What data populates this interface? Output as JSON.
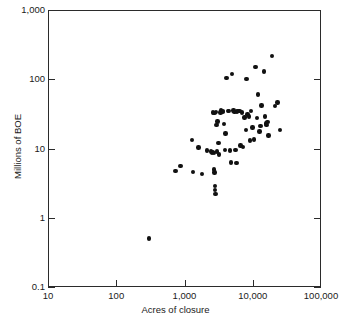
{
  "chart_data": {
    "type": "scatter",
    "title": "",
    "xlabel": "Acres of closure",
    "ylabel": "Millions of BOE",
    "xscale": "log",
    "yscale": "log",
    "xlim": [
      10,
      100000
    ],
    "ylim": [
      0.1,
      1000
    ],
    "grid": false,
    "legend": null,
    "xticklabels": [
      "10",
      "100",
      "1,000",
      "10,000",
      "100,000"
    ],
    "xtickvalues": [
      10,
      100,
      1000,
      10000,
      100000
    ],
    "yticklabels": [
      "1,000",
      "100",
      "10",
      "1",
      "0.1"
    ],
    "ytickvalues": [
      1000,
      100,
      10,
      1,
      0.1
    ],
    "marker": "filled-circle",
    "marker_color": "#111111",
    "n_points": 73,
    "points": [
      {
        "x": 300,
        "y": 0.5
      },
      {
        "x": 740,
        "y": 4.7
      },
      {
        "x": 870,
        "y": 5.6
      },
      {
        "x": 1290,
        "y": 13.2
      },
      {
        "x": 1320,
        "y": 4.6
      },
      {
        "x": 1600,
        "y": 10.3
      },
      {
        "x": 1800,
        "y": 4.3
      },
      {
        "x": 2150,
        "y": 9.3
      },
      {
        "x": 2450,
        "y": 9.0
      },
      {
        "x": 2550,
        "y": 8.8
      },
      {
        "x": 2600,
        "y": 8.9
      },
      {
        "x": 2700,
        "y": 8.7
      },
      {
        "x": 2680,
        "y": 5.0
      },
      {
        "x": 2750,
        "y": 4.5
      },
      {
        "x": 2800,
        "y": 2.9
      },
      {
        "x": 2820,
        "y": 2.5
      },
      {
        "x": 2850,
        "y": 2.2
      },
      {
        "x": 2600,
        "y": 33.0
      },
      {
        "x": 2750,
        "y": 32.5
      },
      {
        "x": 2880,
        "y": 33.5
      },
      {
        "x": 2950,
        "y": 22.0
      },
      {
        "x": 3050,
        "y": 24.5
      },
      {
        "x": 3150,
        "y": 12.0
      },
      {
        "x": 3200,
        "y": 8.2
      },
      {
        "x": 3350,
        "y": 33.0
      },
      {
        "x": 3450,
        "y": 35.5
      },
      {
        "x": 3600,
        "y": 34.0
      },
      {
        "x": 3700,
        "y": 35.0
      },
      {
        "x": 3800,
        "y": 22.5
      },
      {
        "x": 3900,
        "y": 9.5
      },
      {
        "x": 4000,
        "y": 16.5
      },
      {
        "x": 4100,
        "y": 105.0
      },
      {
        "x": 4300,
        "y": 34.5
      },
      {
        "x": 4500,
        "y": 35.0
      },
      {
        "x": 4600,
        "y": 9.4
      },
      {
        "x": 4800,
        "y": 6.3
      },
      {
        "x": 5000,
        "y": 120.0
      },
      {
        "x": 5200,
        "y": 35.5
      },
      {
        "x": 5400,
        "y": 34.0
      },
      {
        "x": 5600,
        "y": 9.6
      },
      {
        "x": 5800,
        "y": 6.2
      },
      {
        "x": 6100,
        "y": 35.0
      },
      {
        "x": 6400,
        "y": 34.5
      },
      {
        "x": 6600,
        "y": 11.0
      },
      {
        "x": 6900,
        "y": 33.0
      },
      {
        "x": 7200,
        "y": 10.5
      },
      {
        "x": 7600,
        "y": 28.0
      },
      {
        "x": 7900,
        "y": 18.5
      },
      {
        "x": 8100,
        "y": 100.0
      },
      {
        "x": 8400,
        "y": 31.0
      },
      {
        "x": 8800,
        "y": 29.0
      },
      {
        "x": 9100,
        "y": 13.0
      },
      {
        "x": 9500,
        "y": 35.0
      },
      {
        "x": 9900,
        "y": 20.0
      },
      {
        "x": 10500,
        "y": 13.5
      },
      {
        "x": 11000,
        "y": 150.0
      },
      {
        "x": 11500,
        "y": 27.5
      },
      {
        "x": 12000,
        "y": 60.0
      },
      {
        "x": 12500,
        "y": 17.5
      },
      {
        "x": 13000,
        "y": 21.0
      },
      {
        "x": 13500,
        "y": 42.0
      },
      {
        "x": 14500,
        "y": 130.0
      },
      {
        "x": 15000,
        "y": 29.0
      },
      {
        "x": 15500,
        "y": 23.0
      },
      {
        "x": 16000,
        "y": 22.0
      },
      {
        "x": 16500,
        "y": 24.0
      },
      {
        "x": 17000,
        "y": 15.5
      },
      {
        "x": 19000,
        "y": 215.0
      },
      {
        "x": 21000,
        "y": 41.0
      },
      {
        "x": 23000,
        "y": 46.0
      },
      {
        "x": 25000,
        "y": 18.5
      },
      {
        "x": 3000,
        "y": 9.1
      },
      {
        "x": 5900,
        "y": 34.2
      }
    ]
  },
  "axes": {
    "x_title": "Acres of closure",
    "y_title": "Millions of BOE",
    "x_ticks": [
      {
        "value": 10,
        "label": "10"
      },
      {
        "value": 100,
        "label": "100"
      },
      {
        "value": 1000,
        "label": "1,000"
      },
      {
        "value": 10000,
        "label": "10,000"
      },
      {
        "value": 100000,
        "label": "100,000"
      }
    ],
    "y_ticks": [
      {
        "value": 1000,
        "label": "1,000"
      },
      {
        "value": 100,
        "label": "100"
      },
      {
        "value": 10,
        "label": "10"
      },
      {
        "value": 1,
        "label": "1"
      },
      {
        "value": 0.1,
        "label": "0.1"
      }
    ]
  },
  "style": {
    "background": "#ffffff",
    "axis_color": "#2b2b2b",
    "text_color": "#1a1a1a",
    "marker_color": "#111111"
  }
}
